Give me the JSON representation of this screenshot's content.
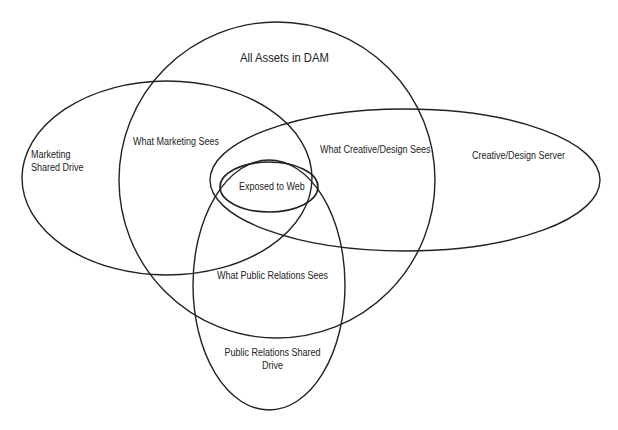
{
  "diagram": {
    "type": "venn",
    "stroke_color": "#222222",
    "background": "#ffffff",
    "sets": [
      {
        "id": "dam",
        "label": "All Assets in DAM",
        "cx": 277,
        "cy": 180,
        "rx": 158,
        "ry": 158
      },
      {
        "id": "marketing",
        "label": "Marketing Shared Drive",
        "cx": 167,
        "cy": 178,
        "rx": 145,
        "ry": 97
      },
      {
        "id": "creative",
        "label": "Creative/Design Server",
        "cx": 405,
        "cy": 180,
        "rx": 195,
        "ry": 71
      },
      {
        "id": "pr",
        "label": "Public Relations Shared Drive",
        "cx": 269,
        "cy": 285,
        "rx": 76,
        "ry": 125
      },
      {
        "id": "web",
        "label": "Exposed to Web",
        "cx": 269,
        "cy": 187,
        "rx": 49,
        "ry": 25
      }
    ],
    "labels": {
      "all_assets": "All Assets in DAM",
      "marketing_drive_line1": "Marketing",
      "marketing_drive_line2": "Shared Drive",
      "what_marketing_sees": "What Marketing Sees",
      "what_creative_sees": "What Creative/Design Sees",
      "creative_server": "Creative/Design Server",
      "exposed_to_web": "Exposed to Web",
      "what_pr_sees": "What Public Relations Sees",
      "pr_drive_line1": "Public Relations Shared",
      "pr_drive_line2": "Drive"
    }
  }
}
